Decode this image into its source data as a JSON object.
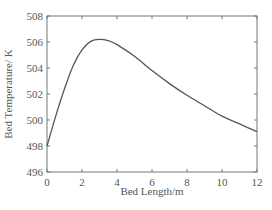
{
  "chart_data": {
    "type": "line",
    "title": "",
    "xlabel": "Bed Length/m",
    "ylabel": "Bed Temperature/ K",
    "xlim": [
      0,
      12
    ],
    "ylim": [
      496,
      508
    ],
    "xticks": [
      0,
      2,
      4,
      6,
      8,
      10,
      12
    ],
    "yticks": [
      496,
      498,
      500,
      502,
      504,
      506,
      508
    ],
    "grid": false,
    "legend": null,
    "series": [
      {
        "name": "Bed Temperature",
        "color": "#555555",
        "x": [
          0,
          0.5,
          1,
          1.5,
          2,
          2.5,
          3,
          3.5,
          4,
          5,
          6,
          7,
          8,
          9,
          10,
          11,
          12
        ],
        "y": [
          498.0,
          500.3,
          502.4,
          504.2,
          505.4,
          506.05,
          506.2,
          506.1,
          505.8,
          504.9,
          503.8,
          502.8,
          501.9,
          501.1,
          500.3,
          499.7,
          499.1
        ]
      }
    ]
  }
}
